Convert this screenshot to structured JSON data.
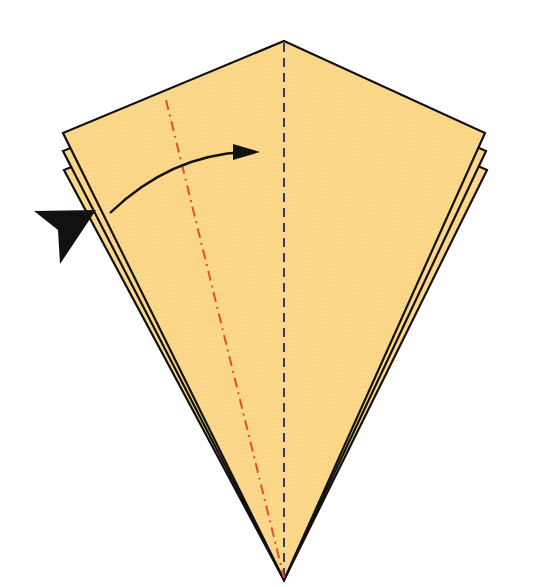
{
  "diagram": {
    "paper_color": "#FBD88A",
    "paper_stroke": "#111111",
    "valley_line_color": "#3A3A6A",
    "mountain_line_color": "#E0502A",
    "arrow_color": "#111111",
    "layers": 3,
    "elements": [
      {
        "name": "kite-layer",
        "role": "paper layer (bottom)"
      },
      {
        "name": "kite-layer",
        "role": "paper layer (middle)"
      },
      {
        "name": "kite-layer",
        "role": "paper layer (top)"
      },
      {
        "name": "valley-fold-line",
        "role": "vertical dashed center crease"
      },
      {
        "name": "mountain-fold-line",
        "role": "red dash-dot crease on left flap"
      },
      {
        "name": "fold-arrow",
        "role": "curved arrow from left edge to center"
      },
      {
        "name": "push-arrow-icon",
        "role": "black pointer indicating insert/squash"
      }
    ]
  }
}
